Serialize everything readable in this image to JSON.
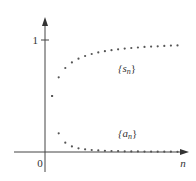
{
  "chart_data": {
    "type": "scatter",
    "title": "",
    "xlabel": "n",
    "ylabel": "",
    "y_ticks": [
      {
        "value": 1,
        "label": "1"
      }
    ],
    "origin_label": "0",
    "grid": false,
    "legend": "inline annotations",
    "series": [
      {
        "name": "{s_n}",
        "label_main": "{s",
        "label_sub": "n",
        "label_close": "}",
        "formula": "n/(n+1)",
        "x": [
          1,
          2,
          3,
          4,
          5,
          6,
          7,
          8,
          9,
          10,
          11,
          12,
          13,
          14,
          15,
          16,
          17,
          18,
          19,
          20
        ],
        "values": [
          0.5,
          0.667,
          0.75,
          0.8,
          0.833,
          0.857,
          0.875,
          0.889,
          0.9,
          0.909,
          0.917,
          0.923,
          0.929,
          0.933,
          0.938,
          0.941,
          0.944,
          0.947,
          0.95,
          0.952
        ]
      },
      {
        "name": "{a_n}",
        "label_main": "{a",
        "label_sub": "n",
        "label_close": "}",
        "formula": "1/(n(n+1))",
        "x": [
          1,
          2,
          3,
          4,
          5,
          6,
          7,
          8,
          9,
          10,
          11,
          12,
          13,
          14,
          15,
          16,
          17,
          18,
          19,
          20
        ],
        "values": [
          0.5,
          0.167,
          0.083,
          0.05,
          0.033,
          0.024,
          0.018,
          0.014,
          0.011,
          0.009,
          0.008,
          0.006,
          0.005,
          0.005,
          0.004,
          0.004,
          0.003,
          0.003,
          0.003,
          0.002
        ]
      }
    ],
    "colors": {
      "axis": "#444444",
      "dots": "#555555",
      "text": "#333333"
    }
  }
}
